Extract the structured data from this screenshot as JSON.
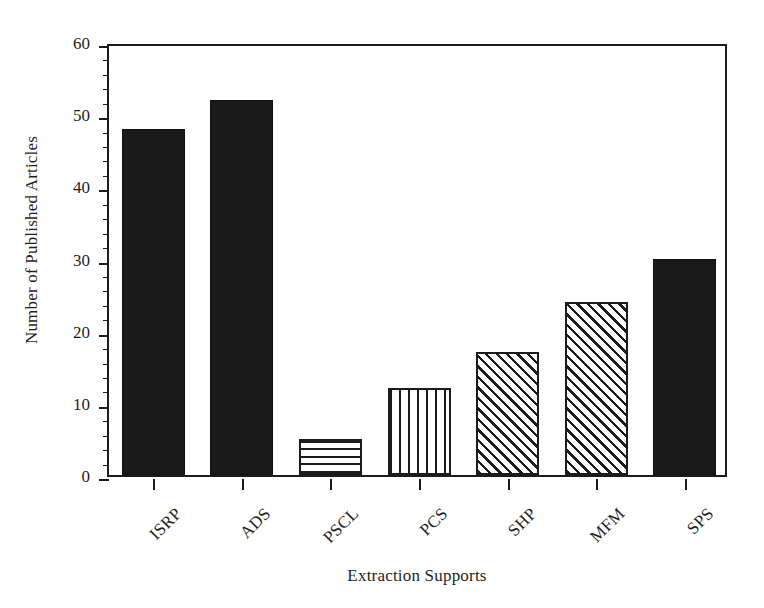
{
  "chart_data": {
    "type": "bar",
    "title": "",
    "xlabel": "Extraction Supports",
    "ylabel": "Number of Published Articles",
    "categories": [
      "ISRP",
      "ADS",
      "PSCL",
      "PCS",
      "SHP",
      "MFM",
      "SPS"
    ],
    "values": [
      48,
      52,
      5,
      12,
      17,
      24,
      30
    ],
    "series": [
      {
        "name": "Number of Published Articles",
        "values": [
          48,
          52,
          5,
          12,
          17,
          24,
          30
        ]
      }
    ],
    "bar_fills": [
      "solid-black",
      "solid-black",
      "horizontal-lines",
      "vertical-lines",
      "diagonal-hatch",
      "diagonal-hatch",
      "solid-black"
    ],
    "ylim": [
      0,
      60
    ],
    "xlim_categories": 7,
    "y_major_ticks": [
      0,
      10,
      20,
      30,
      40,
      50,
      60
    ],
    "y_minor_tick_interval": 2,
    "y_tick_labels": [
      "0",
      "10",
      "20",
      "30",
      "40",
      "50",
      "60"
    ],
    "grid": false,
    "legend": null,
    "legend_position": "none",
    "frame": "full-box",
    "xtick_label_rotation": -45,
    "colors": {
      "bar_solid": "#1a1a1a",
      "bar_pattern_line": "#1b1b1b",
      "bar_pattern_background": "#ffffff",
      "axis": "#1b1b1b",
      "text": "#1f1f1f",
      "background": "#ffffff"
    }
  }
}
